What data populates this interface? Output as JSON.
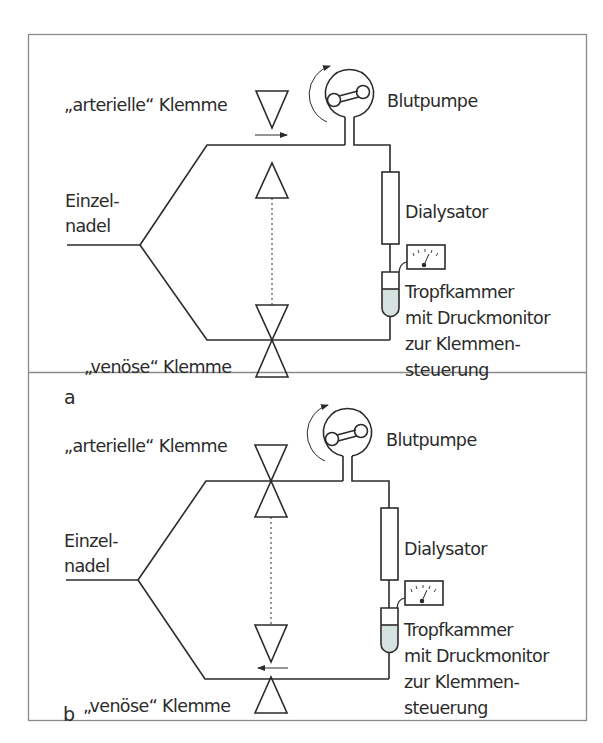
{
  "figure": {
    "panels": [
      {
        "id": "a",
        "letter": "a",
        "labels": {
          "arterial_clamp": "„arterielle“ Klemme",
          "venous_clamp": "„venöse“ Klemme",
          "needle_line1": "Einzel-",
          "needle_line2": "nadel",
          "pump": "Blutpumpe",
          "dialyzer": "Dialysator",
          "drip_line1": "Tropfkammer",
          "drip_line2": "mit Druckmonitor",
          "drip_line3": "zur Klemmen-",
          "drip_line4": "steuerung"
        },
        "state": {
          "arterial_clamp": "open",
          "venous_clamp": "closed",
          "flow_arrow": "right, on arterial line"
        }
      },
      {
        "id": "b",
        "letter": "b",
        "labels": {
          "arterial_clamp": "„arterielle“ Klemme",
          "venous_clamp": "„venöse“ Klemme",
          "needle_line1": "Einzel-",
          "needle_line2": "nadel",
          "pump": "Blutpumpe",
          "dialyzer": "Dialysator",
          "drip_line1": "Tropfkammer",
          "drip_line2": "mit Druckmonitor",
          "drip_line3": "zur Klemmen-",
          "drip_line4": "steuerung"
        },
        "state": {
          "arterial_clamp": "closed",
          "venous_clamp": "open",
          "flow_arrow": "left, on venous line"
        }
      }
    ],
    "colors": {
      "line": "#2b2b2b",
      "frame": "#8a8a8a",
      "drip_fluid": "#d6e2e0",
      "background": "#ffffff"
    }
  }
}
